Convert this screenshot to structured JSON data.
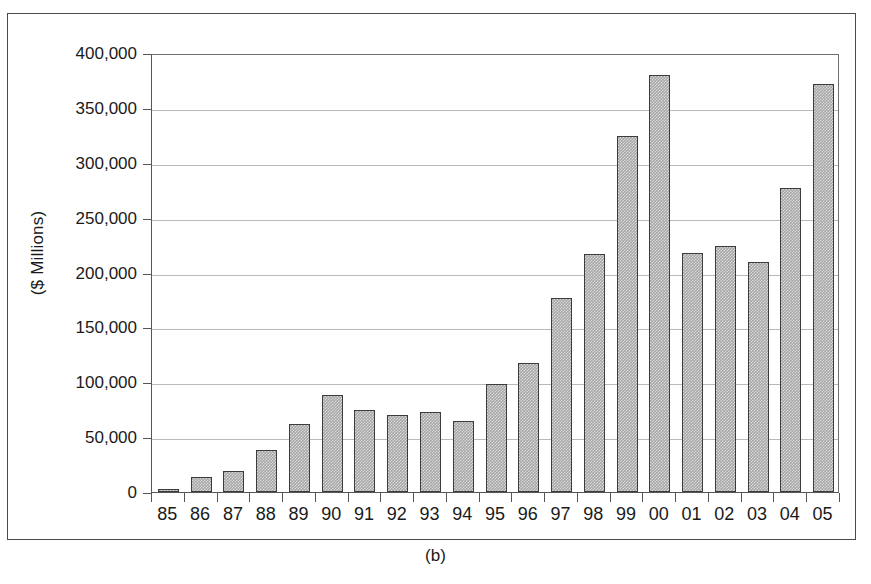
{
  "figure": {
    "caption": "(b)",
    "ylabel": "($ Millions)"
  },
  "chart_data": {
    "type": "bar",
    "title": "",
    "subtitle": "",
    "xlabel": "",
    "ylabel": "($ Millions)",
    "ylim": [
      0,
      400000
    ],
    "ytick_values": [
      0,
      50000,
      100000,
      150000,
      200000,
      250000,
      300000,
      350000,
      400000
    ],
    "ytick_labels": [
      "0",
      "50,000",
      "100,000",
      "150,000",
      "200,000",
      "250,000",
      "300,000",
      "350,000",
      "400,000"
    ],
    "grid": true,
    "grid_axis": "y",
    "legend": null,
    "bar_color": "#a6a6a6",
    "bar_edge_color": "#3c3c3c",
    "categories": [
      "85",
      "86",
      "87",
      "88",
      "89",
      "90",
      "91",
      "92",
      "93",
      "94",
      "95",
      "96",
      "97",
      "98",
      "99",
      "00",
      "01",
      "02",
      "03",
      "04",
      "05"
    ],
    "values": [
      3000,
      14000,
      19000,
      38000,
      62000,
      88000,
      75000,
      70000,
      73000,
      65000,
      98000,
      118000,
      177000,
      217000,
      324000,
      380000,
      218000,
      224000,
      210000,
      277000,
      372000
    ]
  }
}
